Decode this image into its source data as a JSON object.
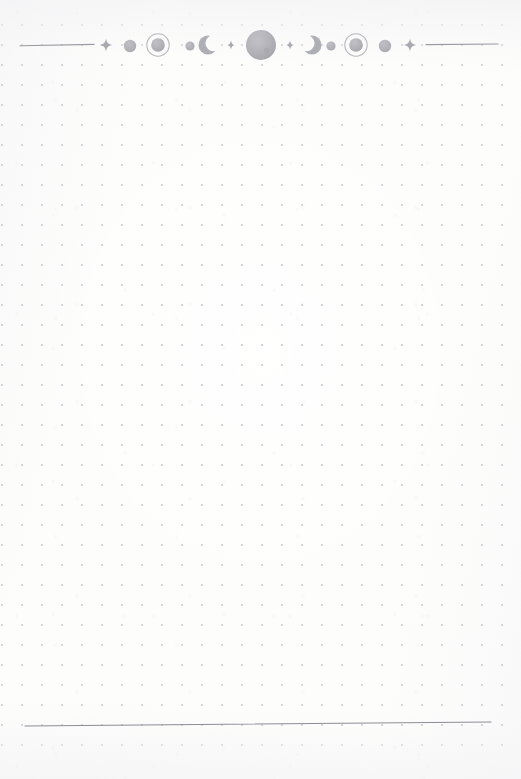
{
  "page": {
    "title": "Dotted Grid Notebook Page",
    "width": 521,
    "height": 779,
    "background_color": "#fdfdfc",
    "paper_tone": "off-white",
    "body_text": "",
    "note": "Blank celestial-themed bullet journal page"
  },
  "dot_grid": {
    "label": "Dot Grid",
    "spacing_px": 20,
    "origin_x": 2,
    "origin_y": 5,
    "dot_radius_px": 1.1,
    "dot_color": "#c9c9d2",
    "columns": 27,
    "rows": 38,
    "top_row_y": 25,
    "bottom_row_y": 745
  },
  "header": {
    "label": "Celestial Header Divider",
    "center_y": 45,
    "ink_color": "#b3b3b8",
    "accent_color": "#aaaaae",
    "rule_color": "#9b9ba1",
    "rules": [
      {
        "name": "left-rule",
        "x1": 20,
        "x2": 94,
        "y": 45
      },
      {
        "name": "right-rule",
        "x1": 426,
        "x2": 498,
        "y": 45
      }
    ],
    "ornaments": [
      {
        "name": "sparkle-left-outer",
        "type": "sparkle",
        "cx": 106,
        "cy": 45,
        "size": 5.4
      },
      {
        "name": "planet-small-left",
        "type": "circle",
        "cx": 130,
        "cy": 46,
        "r": 6.2
      },
      {
        "name": "ringed-planet-left",
        "type": "ringed-circle",
        "cx": 158,
        "cy": 45,
        "r": 6.8,
        "ring_r": 11.2
      },
      {
        "name": "planet-tiny-left",
        "type": "circle",
        "cx": 190,
        "cy": 46,
        "r": 4.6
      },
      {
        "name": "crescent-waxing",
        "type": "crescent",
        "cx": 208,
        "cy": 45,
        "r": 9.5,
        "facing": "right"
      },
      {
        "name": "sparkle-left-inner",
        "type": "sparkle",
        "cx": 231,
        "cy": 45,
        "size": 4.6
      },
      {
        "name": "planet-large-center",
        "type": "circle",
        "cx": 261,
        "cy": 45,
        "r": 15.0
      },
      {
        "name": "sparkle-right-inner",
        "type": "sparkle",
        "cx": 290,
        "cy": 45,
        "size": 4.6
      },
      {
        "name": "crescent-waning",
        "type": "crescent",
        "cx": 312,
        "cy": 45,
        "r": 9.5,
        "facing": "left"
      },
      {
        "name": "planet-tiny-right",
        "type": "circle",
        "cx": 331,
        "cy": 46,
        "r": 4.6
      },
      {
        "name": "ringed-planet-right",
        "type": "ringed-circle",
        "cx": 356,
        "cy": 45,
        "r": 6.8,
        "ring_r": 11.2
      },
      {
        "name": "planet-small-right",
        "type": "circle",
        "cx": 385,
        "cy": 46,
        "r": 6.2
      },
      {
        "name": "sparkle-right-outer",
        "type": "sparkle",
        "cx": 410,
        "cy": 45,
        "size": 5.4
      }
    ]
  },
  "footer": {
    "label": "Footer Divider Rule",
    "rule": {
      "name": "bottom-rule",
      "x1": 25,
      "x2": 491,
      "y1": 726,
      "y2": 722
    },
    "rule_color": "#8e8e95",
    "thickness": 1.15
  },
  "content": {
    "body_area_label": "Writing Area",
    "entries": [],
    "placeholder": ""
  }
}
